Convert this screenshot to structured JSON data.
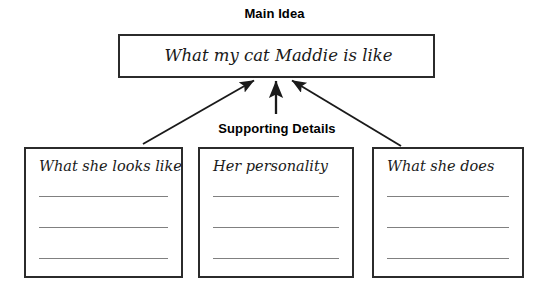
{
  "worksheet": {
    "main_idea": {
      "label": "Main Idea",
      "text": "What my cat Maddie is like"
    },
    "supporting_details": {
      "label": "Supporting Details",
      "boxes": [
        {
          "heading": "What she looks like",
          "lines": [
            "",
            "",
            ""
          ]
        },
        {
          "heading": "Her personality",
          "lines": [
            "",
            "",
            ""
          ]
        },
        {
          "heading": "What she does",
          "lines": [
            "",
            "",
            ""
          ]
        }
      ]
    },
    "colors": {
      "background": "#ffffff",
      "box_border": "#2b2b2b",
      "text": "#000000",
      "handwriting": "#1a1a1a",
      "writing_line": "#808080",
      "arrow": "#1a1a1a"
    }
  }
}
